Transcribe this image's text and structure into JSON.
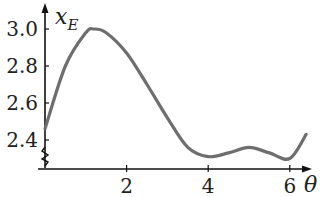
{
  "chart_data": {
    "type": "line",
    "title": "",
    "xlabel": "θ",
    "ylabel": "x_E",
    "ylabel_main": "x",
    "ylabel_sub": "E",
    "xlim": [
      0,
      6.6
    ],
    "ylim": [
      2.25,
      3.05
    ],
    "x_ticks": [
      2,
      4,
      6
    ],
    "x_tick_labels": [
      "2",
      "4",
      "6"
    ],
    "y_ticks": [
      2.4,
      2.6,
      2.8,
      3.0
    ],
    "y_tick_labels": [
      "2.4",
      "2.6",
      "2.8",
      "3.0"
    ],
    "axis_break": true,
    "grid": false,
    "legend": null,
    "series": [
      {
        "name": "x_E",
        "color": "#6e6e6e",
        "x": [
          0,
          0.5,
          1.0,
          1.2,
          1.5,
          2.0,
          2.5,
          3.0,
          3.5,
          4.0,
          4.5,
          5.0,
          5.5,
          6.0,
          6.4
        ],
        "y": [
          2.46,
          2.8,
          2.98,
          3.0,
          2.98,
          2.87,
          2.7,
          2.52,
          2.36,
          2.31,
          2.33,
          2.36,
          2.33,
          2.3,
          2.43
        ]
      }
    ]
  }
}
